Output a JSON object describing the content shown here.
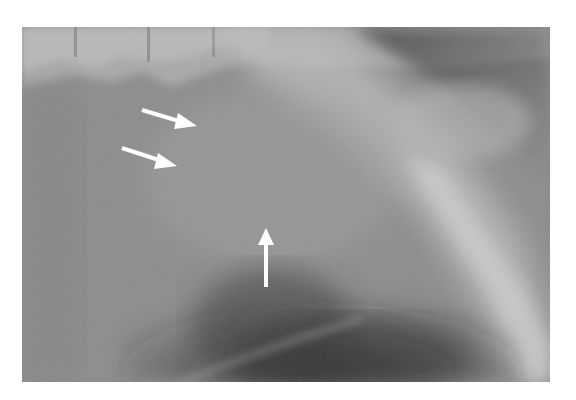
{
  "image": {
    "kind": "radiograph",
    "frame": {
      "x": 22,
      "y": 27,
      "width": 528,
      "height": 355
    },
    "background_color": "#ffffff",
    "tones": {
      "base": "#8a8a8a",
      "light": "#c4c4c4",
      "dark": "#3a3a3a",
      "mid": "#9a9a9a"
    }
  },
  "annotations": {
    "arrows": [
      {
        "id": "arrow-1",
        "direction": "right-down",
        "from": [
          142,
          110
        ],
        "to": [
          197,
          127
        ],
        "color": "#ffffff"
      },
      {
        "id": "arrow-2",
        "direction": "right-down",
        "from": [
          122,
          148
        ],
        "to": [
          177,
          166
        ],
        "color": "#ffffff"
      },
      {
        "id": "arrow-3",
        "direction": "up",
        "from": [
          266,
          287
        ],
        "to": [
          266,
          228
        ],
        "color": "#ffffff"
      }
    ]
  }
}
